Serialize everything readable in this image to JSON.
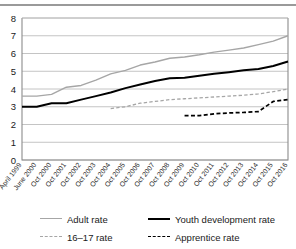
{
  "chart_data": {
    "type": "line",
    "title": "",
    "xlabel": "",
    "ylabel": "",
    "ylim": [
      0,
      8
    ],
    "yticks": [
      0,
      1,
      2,
      3,
      4,
      5,
      6,
      7,
      8
    ],
    "grid": true,
    "legend_position": "bottom",
    "categories": [
      "April 1999",
      "June 2000",
      "Oct 2000",
      "Oct 2001",
      "Oct 2002",
      "Oct 2003",
      "Oct 2004",
      "Oct 2005",
      "Oct 2006",
      "Oct 2007",
      "Oct 2008",
      "Oct 2009",
      "Oct 2010",
      "Oct 2011",
      "Oct 2012",
      "Oct 2013",
      "Oct 2014",
      "Oct 2015",
      "Oct 2016"
    ],
    "series": [
      {
        "name": "Adult rate",
        "color": "#a6a6a6",
        "style": "solid",
        "values": [
          3.6,
          3.6,
          3.7,
          4.1,
          4.2,
          4.5,
          4.85,
          5.05,
          5.35,
          5.52,
          5.73,
          5.8,
          5.93,
          6.08,
          6.19,
          6.31,
          6.5,
          6.7,
          7.0
        ]
      },
      {
        "name": "Youth development rate",
        "color": "#000000",
        "style": "solid",
        "values": [
          3.0,
          3.0,
          3.2,
          3.2,
          3.4,
          3.6,
          3.8,
          4.05,
          4.25,
          4.45,
          4.6,
          4.64,
          4.75,
          4.86,
          4.95,
          5.05,
          5.13,
          5.3,
          5.55
        ]
      },
      {
        "name": "16–17 rate",
        "color": "#a6a6a6",
        "style": "dashed",
        "values": [
          null,
          null,
          null,
          null,
          null,
          null,
          2.9,
          3.0,
          3.2,
          3.3,
          3.4,
          3.45,
          3.5,
          3.55,
          3.6,
          3.65,
          3.72,
          3.85,
          4.0
        ]
      },
      {
        "name": "Apprentice rate",
        "color": "#000000",
        "style": "dashed",
        "values": [
          null,
          null,
          null,
          null,
          null,
          null,
          null,
          null,
          null,
          null,
          null,
          2.5,
          2.5,
          2.6,
          2.65,
          2.68,
          2.73,
          3.3,
          3.4
        ]
      }
    ]
  },
  "legend": {
    "items": [
      {
        "label": "Adult rate",
        "swatch": "solid-gray-line-icon"
      },
      {
        "label": "Youth development rate",
        "swatch": "solid-black-line-icon"
      },
      {
        "label": "16–17 rate",
        "swatch": "dashed-gray-line-icon"
      },
      {
        "label": "Apprentice rate",
        "swatch": "dashed-black-line-icon"
      }
    ]
  }
}
